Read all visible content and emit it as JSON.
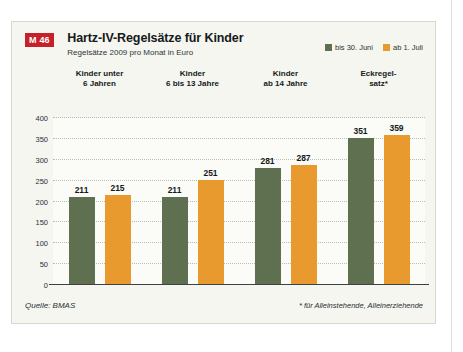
{
  "badge": {
    "label": "M 46"
  },
  "header": {
    "title": "Hartz-IV-Regelsätze für Kinder",
    "subtitle": "Regelsätze 2009 pro Monat in Euro"
  },
  "legend": {
    "items": [
      {
        "label": "bis 30. Juni",
        "color": "#5e7050"
      },
      {
        "label": "ab 1. Juli",
        "color": "#e89a2e"
      }
    ]
  },
  "footer": {
    "source": "Quelle: BMAS",
    "footnote": "* für Alleinstehende, Alleinerziehende"
  },
  "colors": {
    "green": "#5e7050",
    "orange": "#e89a2e",
    "badge_red": "#c62128",
    "card_bg": "#f4f6ef",
    "plot_bg": "#fbfcf7",
    "grid": "#b9beb4",
    "axis": "#3c4146"
  },
  "chart_data": {
    "type": "bar",
    "title": "Hartz-IV-Regelsätze für Kinder",
    "subtitle": "Regelsätze 2009 pro Monat in Euro",
    "xlabel": "",
    "ylabel": "",
    "ylim": [
      0,
      400
    ],
    "yticks": [
      0,
      50,
      100,
      150,
      200,
      250,
      300,
      350,
      400
    ],
    "grid": true,
    "legend_position": "top-right",
    "categories": [
      "Kinder unter\n6 Jahren",
      "Kinder\n6 bis 13 Jahre",
      "Kinder\nab 14 Jahre",
      "Eckregel-\nsatz*"
    ],
    "category_lines": [
      [
        "Kinder unter",
        "6 Jahren"
      ],
      [
        "Kinder",
        "6 bis 13 Jahre"
      ],
      [
        "Kinder",
        "ab 14 Jahre"
      ],
      [
        "Eckregel-",
        "satz*"
      ]
    ],
    "series": [
      {
        "name": "bis 30. Juni",
        "color": "#5e7050",
        "values": [
          211,
          211,
          281,
          351
        ]
      },
      {
        "name": "ab 1. Juli",
        "color": "#e89a2e",
        "values": [
          215,
          251,
          287,
          359
        ]
      }
    ],
    "annotations": {
      "source": "Quelle: BMAS",
      "footnote": "* für Alleinstehende, Alleinerziehende"
    }
  }
}
